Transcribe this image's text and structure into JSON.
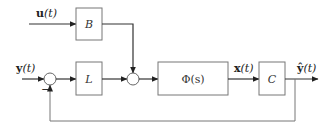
{
  "diagram": {
    "type": "block-diagram",
    "inputs": {
      "u": {
        "label_bold": "u",
        "label_rest": "(t)"
      },
      "y": {
        "label_bold": "y",
        "label_rest": "(t)"
      }
    },
    "blocks": {
      "B": {
        "label": "B"
      },
      "L": {
        "label": "L"
      },
      "Phi": {
        "label": "Φ(s)"
      },
      "C": {
        "label": "C"
      }
    },
    "signals": {
      "x": {
        "label_bold": "x",
        "label_rest": "(t)"
      },
      "yhat": {
        "label_bold": "ŷ",
        "label_rest": "(t)"
      }
    },
    "summing_junctions": [
      {
        "id": "sum1",
        "feedback_sign": "−"
      },
      {
        "id": "sum2"
      }
    ],
    "colors": {
      "line": "#333333",
      "box_stroke": "#777777",
      "background": "#ffffff"
    }
  }
}
